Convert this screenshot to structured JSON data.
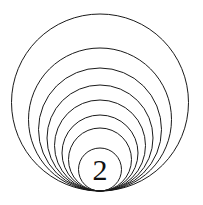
{
  "figure": {
    "type": "geometric-diagram",
    "canvas": {
      "width": 203,
      "height": 205,
      "background": "#ffffff"
    },
    "stroke_color": "#1a1a1a",
    "stroke_width": 1,
    "tangent_point": {
      "x": 100,
      "y": 191
    },
    "label": {
      "text": "2",
      "font_size_px": 30,
      "color": "#111111",
      "center_x": 100,
      "center_y": 170
    },
    "circles": [
      {
        "name": "circle-1-outermost",
        "cx": 100,
        "cy": 102.5,
        "r": 88.5,
        "top_y": 14
      },
      {
        "name": "circle-2",
        "cx": 100,
        "cy": 119.5,
        "r": 71.5,
        "top_y": 48
      },
      {
        "name": "circle-3",
        "cx": 100,
        "cy": 129.5,
        "r": 61.5,
        "top_y": 68
      },
      {
        "name": "circle-4",
        "cx": 100,
        "cy": 138.0,
        "r": 53.0,
        "top_y": 85
      },
      {
        "name": "circle-5",
        "cx": 100,
        "cy": 145.5,
        "r": 45.5,
        "top_y": 100
      },
      {
        "name": "circle-6",
        "cx": 100,
        "cy": 153.0,
        "r": 38.0,
        "top_y": 115
      },
      {
        "name": "circle-7",
        "cx": 100,
        "cy": 159.5,
        "r": 31.5,
        "top_y": 128
      },
      {
        "name": "circle-8-innermost",
        "cx": 100,
        "cy": 169.5,
        "r": 21.5,
        "top_y": 148
      }
    ],
    "circle_count": 8
  },
  "chart_data": {
    "type": "scatter",
    "xlabel": "",
    "ylabel": "",
    "series": [
      {
        "name": "circle-radii",
        "values": [
          88.5,
          71.5,
          61.5,
          53.0,
          45.5,
          38.0,
          31.5,
          21.5
        ]
      },
      {
        "name": "circle-top-y",
        "values": [
          14,
          48,
          68,
          85,
          100,
          115,
          128,
          148
        ]
      }
    ],
    "annotations": [
      "2"
    ]
  }
}
